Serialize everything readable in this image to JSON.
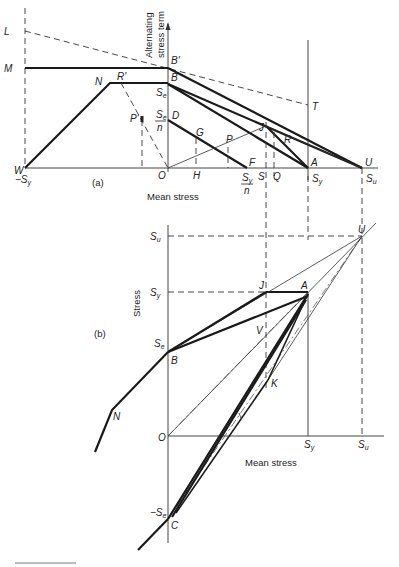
{
  "figure_a": {
    "caption": "(a)",
    "y_axis_label_line1": "Alternating",
    "y_axis_label_line2": "stress term",
    "x_axis_label": "Mean stress",
    "points": {
      "L": "L",
      "M": "M",
      "N": "N",
      "R_prime": "R'",
      "B_prime": "B'",
      "B": "B",
      "D": "D",
      "P_prime": "P'",
      "G": "G",
      "P": "P",
      "F": "F",
      "J": "J",
      "R": "R",
      "T": "T",
      "A": "A",
      "U": "U",
      "W": "W",
      "O": "O",
      "H": "H",
      "S": "S",
      "Q": "Q"
    },
    "ticks": {
      "neg_sy": "−S",
      "neg_sy_sub": "y",
      "se": "S",
      "se_sub": "e",
      "se_over_n_num": "S",
      "se_over_n_num_sub": "e",
      "se_over_n_den": "n",
      "sy_over_n_num": "S",
      "sy_over_n_num_sub": "y",
      "sy_over_n_den": "n",
      "sy": "S",
      "sy_sub": "y",
      "su": "S",
      "su_sub": "u"
    }
  },
  "figure_b": {
    "caption": "(b)",
    "y_axis_label": "Stress",
    "x_axis_label": "Mean stress",
    "points": {
      "U": "U",
      "J": "J",
      "A": "A",
      "V": "V",
      "B": "B",
      "K": "K",
      "N": "N",
      "O": "O",
      "C": "C"
    },
    "ticks": {
      "su": "S",
      "su_sub": "u",
      "sy": "S",
      "sy_sub": "y",
      "se": "S",
      "se_sub": "e",
      "neg_se": "−S",
      "neg_se_sub": "e",
      "x_sy": "S",
      "x_sy_sub": "y",
      "x_su": "S",
      "x_su_sub": "u"
    }
  }
}
